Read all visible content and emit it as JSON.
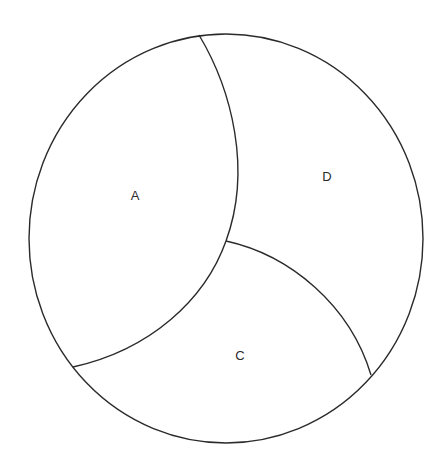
{
  "diagram": {
    "type": "partitioned-circle",
    "stroke_color": "#2a2a2a",
    "background": "#ffffff",
    "regions": [
      {
        "id": "A",
        "label": "A"
      },
      {
        "id": "D",
        "label": "D"
      },
      {
        "id": "C",
        "label": "C"
      }
    ]
  }
}
